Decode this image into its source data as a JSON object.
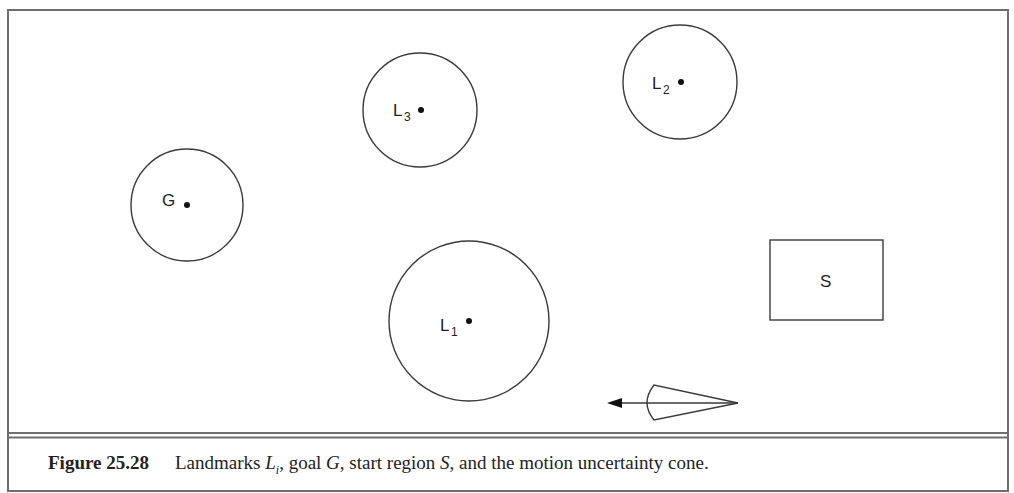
{
  "figure": {
    "number": "Figure 25.28",
    "caption_parts": {
      "p1": "Landmarks ",
      "L": "L",
      "Lsub": "i",
      "p2": ", goal ",
      "G": "G",
      "p3": ", start region ",
      "S": "S",
      "p4": ", and the motion uncertainty cone."
    }
  },
  "regions": {
    "goal": {
      "label": "G",
      "cx": 187,
      "cy": 205,
      "r": 56
    },
    "landmark1": {
      "label": "L",
      "sub": "1",
      "cx": 469,
      "cy": 321,
      "r": 80
    },
    "landmark2": {
      "label": "L",
      "sub": "2",
      "cx": 680,
      "cy": 82,
      "r": 57
    },
    "landmark3": {
      "label": "L",
      "sub": "3",
      "cx": 420,
      "cy": 110,
      "r": 57
    },
    "start": {
      "label": "S",
      "x": 770,
      "y": 240,
      "w": 113,
      "h": 80
    }
  },
  "cone": {
    "apex_x": 738,
    "apex_y": 403,
    "arrow_tip_x": 607
  }
}
